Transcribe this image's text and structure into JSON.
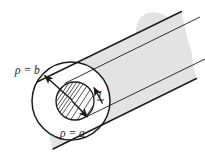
{
  "figure": {
    "type": "technical-diagram",
    "background_color": "#ffffff",
    "stroke_color": "#1a1a1a",
    "body_fill_color": "#e3e3e3",
    "face_fill_color": "#ffffff",
    "hatch_color": "#2a2a2a",
    "labels": {
      "outer_radius": "ρ = b",
      "inner_radius": "ρ = a",
      "current": "I"
    },
    "geometry": {
      "outer_circle": {
        "cx": 71,
        "cy": 101,
        "r": 39
      },
      "inner_circle": {
        "cx": 75,
        "cy": 101,
        "r": 19
      },
      "cylinder_axis_angle_deg": -31,
      "cylinder_length": 150,
      "hatch_spacing": 4.5,
      "hatch_angle_deg": -58
    },
    "arrows": {
      "outer_radius_arrow": {
        "from": [
          71,
          101
        ],
        "to": [
          43,
          74
        ]
      },
      "inner_radius_arrow": {
        "from": [
          71,
          101
        ],
        "to": [
          88,
          118
        ]
      },
      "current_arrow": {
        "from": [
          103,
          104
        ],
        "to": [
          93,
          86
        ]
      }
    }
  }
}
